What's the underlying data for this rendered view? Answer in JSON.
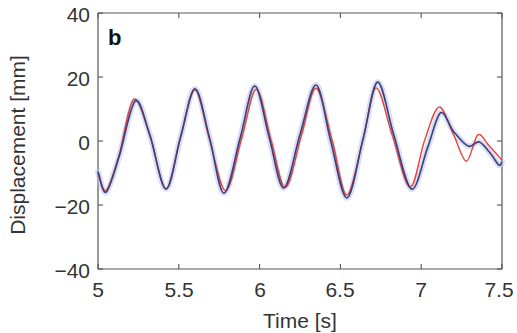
{
  "panel_label": "b",
  "axes": {
    "xlabel": "Time [s]",
    "ylabel": "Displacement [mm]",
    "xticks": [
      "5",
      "5.5",
      "6",
      "6.5",
      "7",
      "7.5"
    ],
    "yticks": [
      "40",
      "20",
      "0",
      "−20",
      "−40"
    ]
  },
  "colors": {
    "measured": "#3a3f7a",
    "measured_halo": "#b9c2ea",
    "model": "#e8403c",
    "axis": "#555555"
  },
  "chart_data": {
    "type": "line",
    "title": "",
    "panel": "b",
    "xlabel": "Time [s]",
    "ylabel": "Displacement [mm]",
    "xlim": [
      5,
      7.5
    ],
    "ylim": [
      -40,
      40
    ],
    "xticks": [
      5,
      5.5,
      6,
      6.5,
      7,
      7.5
    ],
    "yticks": [
      -40,
      -20,
      0,
      20,
      40
    ],
    "grid": false,
    "legend": null,
    "series": [
      {
        "name": "measured (blue, with light-blue shaded band)",
        "color": "#3a3f7a",
        "x": [
          5.0,
          5.05,
          5.13,
          5.23,
          5.32,
          5.42,
          5.51,
          5.6,
          5.69,
          5.78,
          5.88,
          5.97,
          6.06,
          6.15,
          6.25,
          6.35,
          6.44,
          6.54,
          6.64,
          6.73,
          6.83,
          6.94,
          7.04,
          7.12,
          7.2,
          7.29,
          7.36,
          7.43,
          7.48,
          7.5
        ],
        "values": [
          -9.7,
          -16.0,
          -5.0,
          12.5,
          2.0,
          -15.0,
          1.0,
          16.3,
          1.0,
          -16.3,
          1.0,
          17.2,
          1.0,
          -14.7,
          2.0,
          17.5,
          0.0,
          -17.8,
          0.5,
          18.4,
          2.0,
          -15.0,
          -2.0,
          8.8,
          3.0,
          -1.6,
          -0.3,
          -4.0,
          -7.5,
          -6.5
        ]
      },
      {
        "name": "model (red)",
        "color": "#e8403c",
        "x": [
          5.0,
          5.05,
          5.13,
          5.22,
          5.32,
          5.42,
          5.51,
          5.6,
          5.69,
          5.79,
          5.89,
          5.98,
          6.07,
          6.16,
          6.26,
          6.35,
          6.45,
          6.54,
          6.64,
          6.72,
          6.82,
          6.93,
          7.02,
          7.11,
          7.2,
          7.28,
          7.35,
          7.42,
          7.5
        ],
        "values": [
          -9.5,
          -15.5,
          -4.5,
          13.0,
          2.0,
          -15.0,
          1.0,
          16.0,
          0.5,
          -15.5,
          1.0,
          16.2,
          0.5,
          -14.5,
          2.0,
          16.5,
          0.0,
          -16.9,
          0.5,
          16.6,
          2.0,
          -14.4,
          0.0,
          10.6,
          2.0,
          -6.3,
          1.9,
          -1.5,
          -6.0
        ]
      }
    ]
  }
}
